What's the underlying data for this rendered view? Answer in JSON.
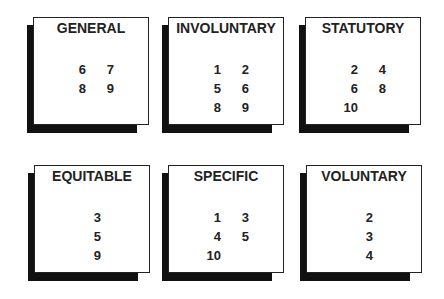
{
  "boxes": [
    {
      "title": "GENERAL",
      "rows": [
        [
          "6",
          "7"
        ],
        [
          "8",
          "9"
        ]
      ]
    },
    {
      "title": "INVOLUNTARY",
      "rows": [
        [
          "1",
          "2"
        ],
        [
          "5",
          "6"
        ],
        [
          "8",
          "9"
        ]
      ]
    },
    {
      "title": "STATUTORY",
      "rows": [
        [
          "2",
          "4"
        ],
        [
          "6",
          "8"
        ],
        [
          "10",
          ""
        ]
      ]
    },
    {
      "title": "EQUITABLE",
      "rows": [
        [
          "3"
        ],
        [
          "5"
        ],
        [
          "9"
        ]
      ]
    },
    {
      "title": "SPECIFIC",
      "rows": [
        [
          "1",
          "3"
        ],
        [
          "4",
          "5"
        ],
        [
          "10",
          ""
        ]
      ]
    },
    {
      "title": "VOLUNTARY",
      "rows": [
        [
          "2"
        ],
        [
          "3"
        ],
        [
          "4"
        ]
      ]
    }
  ]
}
